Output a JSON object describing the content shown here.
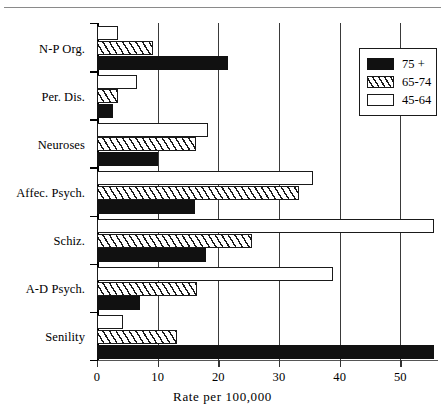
{
  "chart_data": {
    "type": "bar",
    "orientation": "horizontal",
    "title": "",
    "xlabel": "Rate per 100,000",
    "ylabel": "",
    "xlim": [
      0,
      56.2
    ],
    "xticks": [
      0,
      10,
      20,
      30,
      40,
      50
    ],
    "xticklabels": [
      "0",
      "10",
      "20",
      "30",
      "40",
      "50"
    ],
    "grid": "vertical",
    "categories": [
      "N-P Org.",
      "Per. Dis.",
      "Neuroses",
      "Affec. Psych.",
      "Schiz.",
      "A-D Psych.",
      "Senility"
    ],
    "series": [
      {
        "name": "75 +",
        "style": "solid-black",
        "color": "#111111",
        "values": [
          21.6,
          2.6,
          10.0,
          16.1,
          18.0,
          7.1,
          55.6
        ]
      },
      {
        "name": "65-74",
        "style": "hatched",
        "color": "#ffffff",
        "values": [
          9.2,
          3.5,
          16.3,
          33.3,
          25.6,
          16.5,
          13.2
        ]
      },
      {
        "name": "45-64",
        "style": "open-white",
        "color": "#ffffff",
        "values": [
          3.5,
          6.6,
          18.3,
          35.6,
          55.6,
          38.9,
          4.3
        ]
      }
    ],
    "legend": {
      "position": "top-right",
      "entries": [
        "75 +",
        "65-74",
        "45-64"
      ]
    }
  },
  "axis": {
    "x_title": "Rate per 100,000"
  }
}
